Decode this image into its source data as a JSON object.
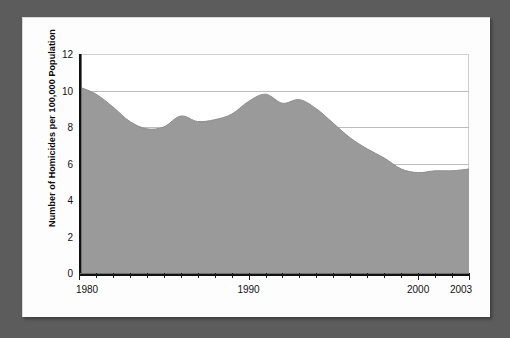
{
  "figure": {
    "frame_color": "#5c5c5c",
    "panel_color": "#fdfdfd",
    "plot_background": "#ffffff"
  },
  "chart_data": {
    "type": "area",
    "title": "",
    "subtitle": "",
    "xlabel": "",
    "ylabel": "Number of Homicides per 100,000 Population",
    "series_name": "Homicide rate",
    "fill_color": "#9a9a9a",
    "line_color": "#8c8c8c",
    "grid": true,
    "grid_color": "#bcbcbc",
    "legend": "none",
    "xlim": [
      1980,
      2003
    ],
    "ylim": [
      0,
      12
    ],
    "ytick_values": [
      0,
      2,
      4,
      6,
      8,
      10,
      12
    ],
    "ytick_labels": [
      "0",
      "2",
      "4",
      "6",
      "8",
      "10",
      "12"
    ],
    "xtick_values": [
      1980,
      1981,
      1982,
      1983,
      1984,
      1985,
      1986,
      1987,
      1988,
      1989,
      1990,
      1991,
      1992,
      1993,
      1994,
      1995,
      1996,
      1997,
      1998,
      1999,
      2000,
      2001,
      2002,
      2003
    ],
    "xtick_labeled": [
      1980,
      1990,
      2000,
      2003
    ],
    "xtick_labels": [
      "1980",
      "1990",
      "2000",
      "2003"
    ],
    "x": [
      1980,
      1981,
      1982,
      1983,
      1984,
      1985,
      1986,
      1987,
      1988,
      1989,
      1990,
      1991,
      1992,
      1993,
      1994,
      1995,
      1996,
      1997,
      1998,
      1999,
      2000,
      2001,
      2002,
      2003
    ],
    "values": [
      10.2,
      9.8,
      9.1,
      8.3,
      7.9,
      8.0,
      8.6,
      8.3,
      8.4,
      8.7,
      9.4,
      9.8,
      9.3,
      9.5,
      9.0,
      8.2,
      7.4,
      6.8,
      6.3,
      5.7,
      5.5,
      5.6,
      5.6,
      5.7
    ]
  }
}
